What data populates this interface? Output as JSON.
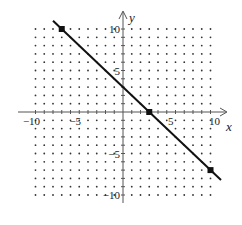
{
  "chart_data": {
    "type": "line",
    "title": "",
    "xlabel": "x",
    "ylabel": "y",
    "xlim": [
      -10,
      10
    ],
    "ylim": [
      -10,
      10
    ],
    "grid": "dotted",
    "x_tick_labels": [
      {
        "value": -10,
        "label": "−10"
      },
      {
        "value": -5,
        "label": "−5"
      },
      {
        "value": 5,
        "label": "5"
      },
      {
        "value": 10,
        "label": "10"
      }
    ],
    "y_tick_labels": [
      {
        "value": 10,
        "label": "10"
      },
      {
        "value": 5,
        "label": "5"
      },
      {
        "value": -5,
        "label": "−5"
      },
      {
        "value": -10,
        "label": "−10"
      }
    ],
    "series": [
      {
        "name": "y = -x + 3",
        "slope": -1,
        "intercept": 3,
        "x": [
          -8,
          11.2
        ],
        "y": [
          11,
          -8.2
        ],
        "color": "#111111"
      }
    ],
    "marked_points": [
      {
        "x": -7,
        "y": 10
      },
      {
        "x": 3,
        "y": 0
      },
      {
        "x": 10,
        "y": -7
      }
    ]
  },
  "colors": {
    "line": "#111111",
    "axis": "#555555",
    "grid_dot": "#333333"
  }
}
